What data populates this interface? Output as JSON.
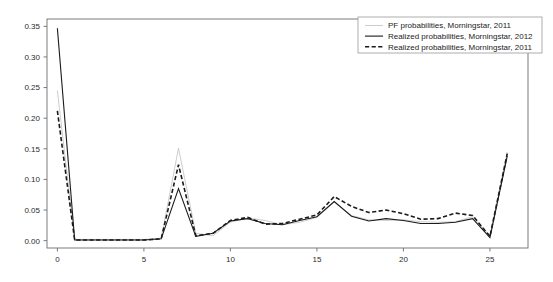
{
  "chart_data": {
    "type": "line",
    "title": "",
    "xlabel": "",
    "ylabel": "",
    "xlim": [
      -0.6,
      27.2
    ],
    "ylim": [
      -0.012,
      0.362
    ],
    "grid": false,
    "legend_position": "top-right",
    "xticks": [
      0,
      5,
      10,
      15,
      20,
      25
    ],
    "xtick_labels": [
      "0",
      "5",
      "10",
      "15",
      "20",
      "25"
    ],
    "yticks": [
      0.0,
      0.05,
      0.1,
      0.15,
      0.2,
      0.25,
      0.3,
      0.35
    ],
    "ytick_labels": [
      "0.00",
      "0.05",
      "0.10",
      "0.15",
      "0.20",
      "0.25",
      "0.30",
      "0.35"
    ],
    "x": [
      0,
      1,
      2,
      3,
      4,
      5,
      6,
      7,
      8,
      9,
      10,
      11,
      12,
      13,
      14,
      15,
      16,
      17,
      18,
      19,
      20,
      21,
      22,
      23,
      24,
      25,
      26
    ],
    "series": [
      {
        "name": "PF probabilities, Morningstar, 2011",
        "style": "solid",
        "color": "#c0c0c0",
        "width": 0.8,
        "values": [
          0.245,
          0.002,
          0.002,
          0.002,
          0.002,
          0.002,
          0.004,
          0.151,
          0.012,
          0.008,
          0.03,
          0.037,
          0.033,
          0.026,
          0.03,
          0.038,
          0.063,
          0.041,
          0.034,
          0.033,
          0.034,
          0.031,
          0.03,
          0.031,
          0.039,
          0.008,
          0.145
        ]
      },
      {
        "name": "Realized probabilities, Morningstar, 2012",
        "style": "solid",
        "color": "#1a1a1a",
        "width": 1.1,
        "values": [
          0.347,
          0.001,
          0.001,
          0.001,
          0.001,
          0.001,
          0.003,
          0.085,
          0.007,
          0.012,
          0.032,
          0.036,
          0.028,
          0.026,
          0.033,
          0.039,
          0.064,
          0.04,
          0.032,
          0.036,
          0.033,
          0.028,
          0.028,
          0.03,
          0.036,
          0.005,
          0.138
        ]
      },
      {
        "name": "Realized probabilities, Morningstar, 2011",
        "style": "dashed",
        "color": "#1a1a1a",
        "width": 1.6,
        "values": [
          0.212,
          0.001,
          0.001,
          0.001,
          0.001,
          0.001,
          0.003,
          0.124,
          0.008,
          0.012,
          0.033,
          0.038,
          0.027,
          0.028,
          0.035,
          0.042,
          0.072,
          0.056,
          0.046,
          0.05,
          0.044,
          0.035,
          0.036,
          0.045,
          0.041,
          0.007,
          0.142
        ]
      }
    ]
  },
  "legend": {
    "entries": [
      {
        "label": "PF probabilities, Morningstar, 2011"
      },
      {
        "label": "Realized probabilities, Morningstar, 2012"
      },
      {
        "label": "Realized probabilities, Morningstar, 2011"
      }
    ]
  }
}
